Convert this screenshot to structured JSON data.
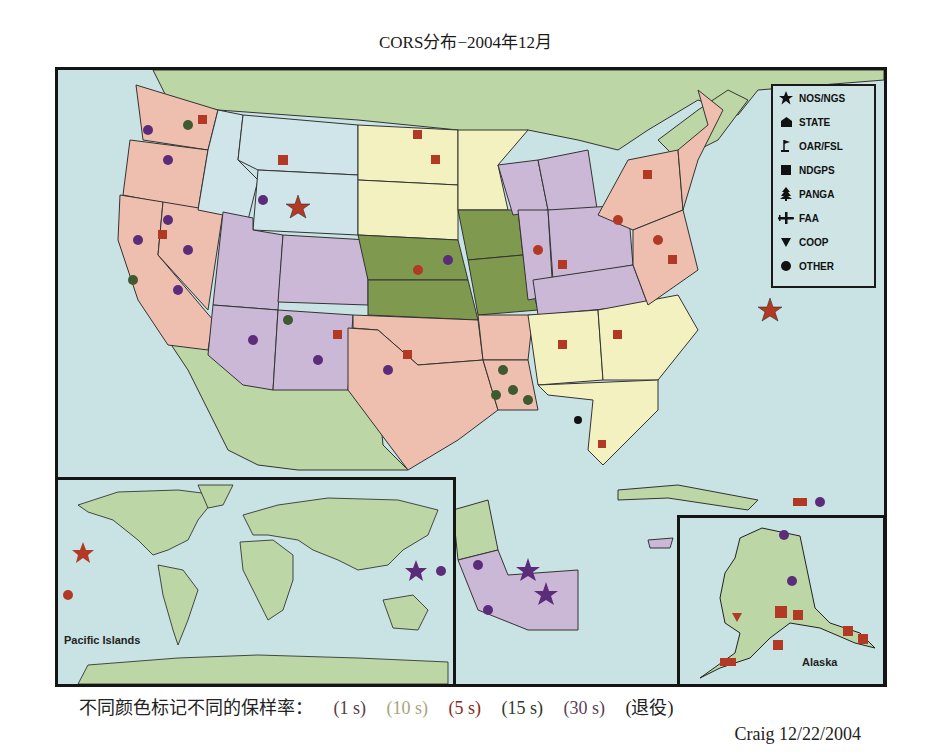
{
  "title": "CORS分布−2004年12月",
  "legend": {
    "items": [
      {
        "icon": "star-icon",
        "label": "NOS/NGS"
      },
      {
        "icon": "house-icon",
        "label": "STATE"
      },
      {
        "icon": "flag-icon",
        "label": "OAR/FSL"
      },
      {
        "icon": "square-icon",
        "label": "NDGPS"
      },
      {
        "icon": "tree-icon",
        "label": "PANGA"
      },
      {
        "icon": "airplane-icon",
        "label": "FAA"
      },
      {
        "icon": "triangle-down-icon",
        "label": "COOP"
      },
      {
        "icon": "circle-icon",
        "label": "OTHER"
      }
    ]
  },
  "insets": {
    "world_label": "Pacific Islands",
    "alaska_label": "Alaska"
  },
  "sampling_rates": {
    "prefix": "不同颜色标记不同的保样率：",
    "items": [
      {
        "label": "(1 s)",
        "color": "#5a3a4a"
      },
      {
        "label": "(10 s)",
        "color": "#a8a57a"
      },
      {
        "label": "(5 s)",
        "color": "#8a2b22"
      },
      {
        "label": "(15 s)",
        "color": "#2e3a2a"
      },
      {
        "label": "(30 s)",
        "color": "#5a3f5a"
      },
      {
        "label": "(退役)",
        "color": "#222222"
      }
    ]
  },
  "credit": "Craig 12/22/2004",
  "colors": {
    "ocean": "#c9e2e3",
    "land": "#bcd6a6",
    "state_pink": "#eebfae",
    "state_lavender": "#cbb7d6",
    "state_yellow": "#f3f1c0",
    "state_green": "#7f9a4e",
    "state_lightblue": "#cfe5ea",
    "marker_red": "#b23a24",
    "marker_purple": "#5b2c7a",
    "marker_green": "#3f5a2e"
  }
}
